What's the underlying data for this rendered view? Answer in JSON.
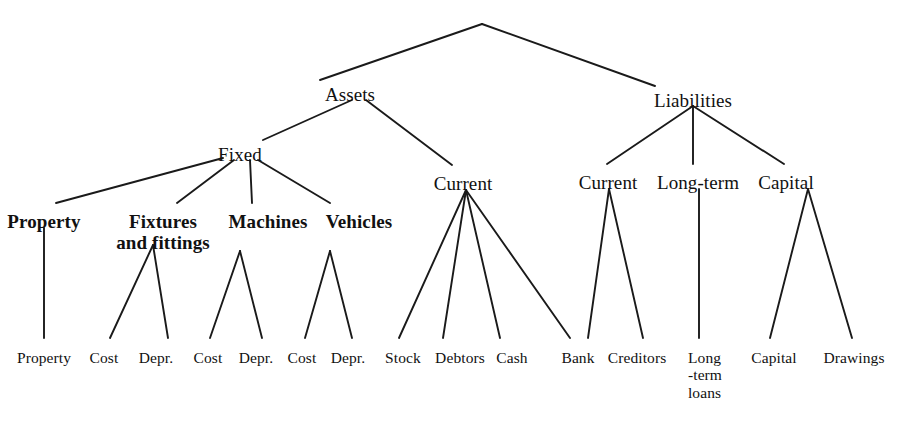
{
  "diagram": {
    "type": "tree-diagram",
    "background_color": "#ffffff",
    "line_color": "#1a1a1a",
    "text_color": "#111111",
    "nodes": [
      {
        "id": "root",
        "label": "",
        "x": 482,
        "y": 24,
        "level": 0,
        "style": "apex"
      },
      {
        "id": "assets",
        "label": "Assets",
        "x": 350,
        "y": 84,
        "level": 1,
        "style": "lvl1"
      },
      {
        "id": "liabilities",
        "label": "Liabilities",
        "x": 693,
        "y": 90,
        "level": 1,
        "style": "lvl1"
      },
      {
        "id": "fixed",
        "label": "Fixed",
        "x": 240,
        "y": 144,
        "level": 2,
        "style": "lvl2"
      },
      {
        "id": "assets-current",
        "label": "Current",
        "x": 463,
        "y": 173,
        "level": 2,
        "style": "lvl2"
      },
      {
        "id": "liab-current",
        "label": "Current",
        "x": 608,
        "y": 172,
        "level": 2,
        "style": "lvl2"
      },
      {
        "id": "long-term",
        "label": "Long-term",
        "x": 698,
        "y": 172,
        "level": 2,
        "style": "lvl2"
      },
      {
        "id": "capital",
        "label": "Capital",
        "x": 786,
        "y": 172,
        "level": 2,
        "style": "lvl2"
      },
      {
        "id": "property",
        "label": "Property",
        "x": 44,
        "y": 211,
        "level": 3,
        "style": "lvl3"
      },
      {
        "id": "fixtures",
        "label": "Fixtures\nand fittings",
        "x": 163,
        "y": 211,
        "level": 3,
        "style": "lvl3"
      },
      {
        "id": "machines",
        "label": "Machines",
        "x": 268,
        "y": 211,
        "level": 3,
        "style": "lvl3"
      },
      {
        "id": "vehicles",
        "label": "Vehicles",
        "x": 359,
        "y": 211,
        "level": 3,
        "style": "lvl3"
      }
    ],
    "leaves": [
      {
        "id": "leaf-property",
        "label": "Property",
        "x": 44,
        "y": 349
      },
      {
        "id": "leaf-cost-1",
        "label": "Cost",
        "x": 104,
        "y": 349
      },
      {
        "id": "leaf-depr-1",
        "label": "Depr.",
        "x": 156,
        "y": 349
      },
      {
        "id": "leaf-cost-2",
        "label": "Cost",
        "x": 208,
        "y": 349
      },
      {
        "id": "leaf-depr-2",
        "label": "Depr.",
        "x": 256,
        "y": 349
      },
      {
        "id": "leaf-cost-3",
        "label": "Cost",
        "x": 302,
        "y": 349
      },
      {
        "id": "leaf-depr-3",
        "label": "Depr.",
        "x": 348,
        "y": 349
      },
      {
        "id": "leaf-stock",
        "label": "Stock",
        "x": 403,
        "y": 349
      },
      {
        "id": "leaf-debtors",
        "label": "Debtors",
        "x": 460,
        "y": 349
      },
      {
        "id": "leaf-cash",
        "label": "Cash",
        "x": 512,
        "y": 349
      },
      {
        "id": "leaf-bank",
        "label": "Bank",
        "x": 578,
        "y": 349
      },
      {
        "id": "leaf-creditors",
        "label": "Creditors",
        "x": 637,
        "y": 349
      },
      {
        "id": "leaf-long-term-loans",
        "label": "Long\n-term\nloans",
        "x": 705,
        "y": 349,
        "multiline": true
      },
      {
        "id": "leaf-capital",
        "label": "Capital",
        "x": 774,
        "y": 349
      },
      {
        "id": "leaf-drawings",
        "label": "Drawings",
        "x": 854,
        "y": 349
      }
    ],
    "edges": [
      {
        "from": "root",
        "to": "assets",
        "x1": 482,
        "y1": 24,
        "x2": 320,
        "y2": 80
      },
      {
        "from": "root",
        "to": "liabilities",
        "x1": 482,
        "y1": 24,
        "x2": 655,
        "y2": 86
      },
      {
        "from": "assets",
        "to": "fixed",
        "x1": 352,
        "y1": 100,
        "x2": 263,
        "y2": 140
      },
      {
        "from": "assets",
        "to": "assets-current",
        "x1": 366,
        "y1": 100,
        "x2": 452,
        "y2": 165
      },
      {
        "from": "liabilities",
        "to": "liab-current",
        "x1": 693,
        "y1": 106,
        "x2": 607,
        "y2": 164
      },
      {
        "from": "liabilities",
        "to": "long-term",
        "x1": 693,
        "y1": 106,
        "x2": 693,
        "y2": 164
      },
      {
        "from": "liabilities",
        "to": "capital",
        "x1": 693,
        "y1": 106,
        "x2": 784,
        "y2": 164
      },
      {
        "from": "fixed",
        "to": "property",
        "x1": 223,
        "y1": 158,
        "x2": 56,
        "y2": 203
      },
      {
        "from": "fixed",
        "to": "fixtures",
        "x1": 234,
        "y1": 160,
        "x2": 177,
        "y2": 203
      },
      {
        "from": "fixed",
        "to": "machines",
        "x1": 250,
        "y1": 160,
        "x2": 252,
        "y2": 203
      },
      {
        "from": "fixed",
        "to": "vehicles",
        "x1": 258,
        "y1": 160,
        "x2": 330,
        "y2": 203
      },
      {
        "from": "property",
        "to": "leaf-property",
        "x1": 44,
        "y1": 228,
        "x2": 44,
        "y2": 338
      },
      {
        "from": "fixtures",
        "to": "leaf-cost-1",
        "x1": 153,
        "y1": 245,
        "x2": 110,
        "y2": 338
      },
      {
        "from": "fixtures",
        "to": "leaf-depr-1",
        "x1": 153,
        "y1": 245,
        "x2": 168,
        "y2": 338
      },
      {
        "from": "machines",
        "to": "leaf-cost-2",
        "x1": 240,
        "y1": 251,
        "x2": 210,
        "y2": 338
      },
      {
        "from": "machines",
        "to": "leaf-depr-2",
        "x1": 240,
        "y1": 251,
        "x2": 262,
        "y2": 338
      },
      {
        "from": "vehicles",
        "to": "leaf-cost-3",
        "x1": 330,
        "y1": 251,
        "x2": 305,
        "y2": 338
      },
      {
        "from": "vehicles",
        "to": "leaf-depr-3",
        "x1": 330,
        "y1": 251,
        "x2": 352,
        "y2": 338
      },
      {
        "from": "assets-current",
        "to": "leaf-stock",
        "x1": 466,
        "y1": 190,
        "x2": 399,
        "y2": 338
      },
      {
        "from": "assets-current",
        "to": "leaf-debtors",
        "x1": 466,
        "y1": 190,
        "x2": 443,
        "y2": 338
      },
      {
        "from": "assets-current",
        "to": "leaf-cash",
        "x1": 466,
        "y1": 190,
        "x2": 500,
        "y2": 338
      },
      {
        "from": "assets-current",
        "to": "leaf-bank",
        "x1": 466,
        "y1": 190,
        "x2": 570,
        "y2": 338
      },
      {
        "from": "liab-current",
        "to": "leaf-creditors",
        "x1": 609,
        "y1": 189,
        "x2": 643,
        "y2": 338
      },
      {
        "from": "liab-current",
        "to": "leaf-bank-right",
        "x1": 609,
        "y1": 189,
        "x2": 588,
        "y2": 338
      },
      {
        "from": "long-term",
        "to": "leaf-long-term-loans",
        "x1": 699,
        "y1": 189,
        "x2": 699,
        "y2": 338
      },
      {
        "from": "capital",
        "to": "leaf-capital",
        "x1": 808,
        "y1": 189,
        "x2": 770,
        "y2": 338
      },
      {
        "from": "capital",
        "to": "leaf-drawings",
        "x1": 808,
        "y1": 189,
        "x2": 852,
        "y2": 338
      }
    ]
  }
}
